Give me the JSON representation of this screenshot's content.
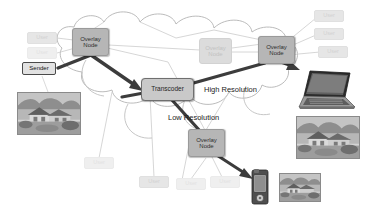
{
  "diagram": {
    "colors": {
      "node_fill": "#b6b6b6",
      "node_faded_fill": "#dcdcdc",
      "transcoder_fill": "#c9c9c9",
      "arrow": "#3c3c3c",
      "cloud_stroke": "#b0b0b0",
      "link_stroke": "#c8c8c8",
      "background": "#ffffff"
    },
    "labels": {
      "overlay_node": "Overlay\nNode",
      "overlay_node_line1": "Overlay",
      "overlay_node_line2": "Node",
      "transcoder": "Transcoder",
      "sender": "Sender",
      "user": "User",
      "high_resolution": "High Resolution",
      "low_resolution": "Low Resolution"
    },
    "nodes": [
      {
        "id": "overlay-node-left",
        "label_line1": "Overlay",
        "label_line2": "Node",
        "state": "active",
        "x": 72,
        "y": 28,
        "w": 37,
        "h": 28
      },
      {
        "id": "overlay-node-middle",
        "label_line1": "Overlay",
        "label_line2": "Node",
        "state": "faded",
        "x": 199,
        "y": 38,
        "w": 33,
        "h": 26
      },
      {
        "id": "overlay-node-right",
        "label_line1": "Overlay",
        "label_line2": "Node",
        "state": "active",
        "x": 258,
        "y": 36,
        "w": 37,
        "h": 28
      },
      {
        "id": "overlay-node-bottom",
        "label_line1": "Overlay",
        "label_line2": "Node",
        "state": "active",
        "x": 188,
        "y": 129,
        "w": 37,
        "h": 28
      }
    ],
    "transcoder": {
      "id": "transcoder",
      "label": "Transcoder",
      "x": 141,
      "y": 78,
      "w": 53,
      "h": 23
    },
    "sender": {
      "id": "sender",
      "label": "Sender",
      "x": 22,
      "y": 62,
      "w": 34,
      "h": 13
    },
    "users": [
      {
        "id": "user-top-left-1",
        "label": "User",
        "dim": "dim",
        "x": 27,
        "y": 32,
        "w": 30,
        "h": 12
      },
      {
        "id": "user-top-left-2",
        "label": "User",
        "dim": "dimmer",
        "x": 27,
        "y": 47,
        "w": 30,
        "h": 12
      },
      {
        "id": "user-top-right-1",
        "label": "User",
        "dim": "dim",
        "x": 314,
        "y": 10,
        "w": 30,
        "h": 12
      },
      {
        "id": "user-top-right-2",
        "label": "User",
        "dim": "dim",
        "x": 314,
        "y": 28,
        "w": 30,
        "h": 12
      },
      {
        "id": "user-top-right-3",
        "label": "User",
        "dim": "dim",
        "x": 318,
        "y": 46,
        "w": 30,
        "h": 12
      },
      {
        "id": "user-bottom-left",
        "label": "User",
        "dim": "dimmer",
        "x": 84,
        "y": 157,
        "w": 30,
        "h": 12
      },
      {
        "id": "user-bottom-mid",
        "label": "User",
        "dim": "dim",
        "x": 139,
        "y": 176,
        "w": 30,
        "h": 12
      },
      {
        "id": "user-bottom-right-1",
        "label": "User",
        "dim": "dimmer",
        "x": 176,
        "y": 178,
        "w": 30,
        "h": 12
      },
      {
        "id": "user-bottom-right-2",
        "label": "User",
        "dim": "dimmer",
        "x": 210,
        "y": 176,
        "w": 30,
        "h": 12
      }
    ],
    "flow_labels": [
      {
        "id": "high-resolution-label",
        "text": "High Resolution",
        "x": 204,
        "y": 85
      },
      {
        "id": "low-resolution-label",
        "text": "Low Resolution",
        "x": 168,
        "y": 113
      }
    ],
    "photos": [
      {
        "id": "source-photo",
        "alt": "house-photo-source",
        "x": 17,
        "y": 92,
        "w": 64,
        "h": 43
      },
      {
        "id": "high-res-output-photo",
        "alt": "house-photo-high-resolution",
        "x": 296,
        "y": 116,
        "w": 64,
        "h": 43
      },
      {
        "id": "low-res-output-photo",
        "alt": "house-photo-low-resolution",
        "x": 279,
        "y": 173,
        "w": 42,
        "h": 29
      }
    ],
    "devices": [
      {
        "id": "laptop-device",
        "alt": "laptop",
        "x": 296,
        "y": 67,
        "w": 62,
        "h": 46
      },
      {
        "id": "pda-device",
        "alt": "handheld-pda",
        "x": 249,
        "y": 168,
        "w": 22,
        "h": 38
      }
    ]
  }
}
